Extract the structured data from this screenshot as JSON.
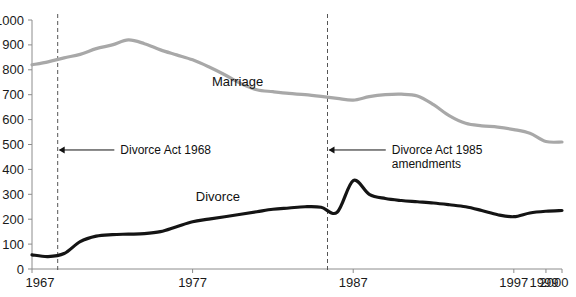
{
  "chart_data": {
    "type": "line",
    "title": "",
    "subtitle": "",
    "xlabel": "",
    "ylabel": "",
    "xlim": [
      1967,
      2000
    ],
    "ylim": [
      0,
      1000
    ],
    "grid": false,
    "legend": "inline-labels",
    "y_ticks": [
      0,
      100,
      200,
      300,
      400,
      500,
      600,
      700,
      800,
      900,
      1000
    ],
    "y_tick_labels": [
      "0",
      "100",
      "200",
      "300",
      "400",
      "500",
      "600",
      "700",
      "800",
      "900",
      "1000"
    ],
    "x_ticks": [
      1967,
      1977,
      1987,
      1997,
      1999,
      2000
    ],
    "x_tick_labels": [
      "1967",
      "1977",
      "1987",
      "1997",
      "1999",
      "2000"
    ],
    "series": [
      {
        "name": "Marriage",
        "color": "#a8a8a8",
        "width": 3.2,
        "label_x": 1978.2,
        "label_y": 735,
        "x": [
          1967,
          1968,
          1969,
          1970,
          1971,
          1972,
          1973,
          1974,
          1975,
          1976,
          1977,
          1978,
          1979,
          1980,
          1981,
          1982,
          1983,
          1984,
          1985,
          1986,
          1987,
          1988,
          1989,
          1990,
          1991,
          1992,
          1993,
          1994,
          1995,
          1996,
          1997,
          1998,
          1999,
          2000
        ],
        "values": [
          820,
          832,
          848,
          862,
          885,
          900,
          920,
          905,
          880,
          860,
          840,
          812,
          780,
          745,
          720,
          712,
          705,
          700,
          693,
          685,
          678,
          692,
          700,
          702,
          695,
          660,
          615,
          585,
          575,
          570,
          560,
          545,
          512,
          510
        ]
      },
      {
        "name": "Divorce",
        "color": "#141414",
        "width": 3.2,
        "label_x": 1977.2,
        "label_y": 275,
        "x": [
          1967,
          1968,
          1969,
          1970,
          1971,
          1972,
          1973,
          1974,
          1975,
          1976,
          1977,
          1978,
          1979,
          1980,
          1981,
          1982,
          1983,
          1984,
          1985,
          1986,
          1987,
          1988,
          1989,
          1990,
          1991,
          1992,
          1993,
          1994,
          1995,
          1996,
          1997,
          1998,
          1999,
          2000
        ],
        "values": [
          57,
          50,
          62,
          110,
          132,
          138,
          140,
          142,
          150,
          170,
          190,
          200,
          210,
          220,
          230,
          240,
          245,
          250,
          248,
          228,
          355,
          300,
          283,
          275,
          270,
          265,
          258,
          250,
          235,
          218,
          210,
          225,
          232,
          235
        ]
      }
    ],
    "annotations": [
      {
        "id": "divorce-act-1968",
        "text_lines": [
          "Divorce Act 1968"
        ],
        "event_x": 1968.6,
        "text_x": 1972.5,
        "text_y": 478,
        "arrow_y": 478
      },
      {
        "id": "divorce-act-1985",
        "text_lines": [
          "Divorce Act 1985",
          "amendments"
        ],
        "event_x": 1985.4,
        "text_x": 1989.4,
        "text_y": 478,
        "arrow_y": 478
      }
    ]
  }
}
